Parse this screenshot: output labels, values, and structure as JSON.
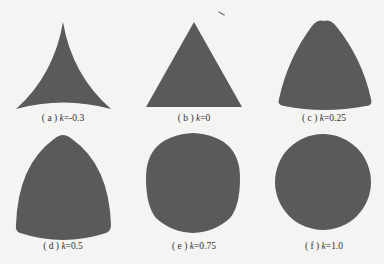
{
  "figure": {
    "fill_color": "#5a5a5a",
    "background": "#f4f4f2",
    "panels": [
      {
        "id": "a",
        "label": "( a )",
        "param": "k",
        "value": "=-0.3",
        "shape": "concave-triangle"
      },
      {
        "id": "b",
        "label": "( b )",
        "param": "k",
        "value": "=0",
        "shape": "triangle"
      },
      {
        "id": "c",
        "label": "( c )",
        "param": "k",
        "value": "=0.25",
        "shape": "convex-triangle"
      },
      {
        "id": "d",
        "label": "( d )",
        "param": "k",
        "value": "=0.5",
        "shape": "reuleaux-like-triangle"
      },
      {
        "id": "e",
        "label": "( e )",
        "param": "k",
        "value": "=0.75",
        "shape": "rounded-triangle"
      },
      {
        "id": "f",
        "label": "( f )",
        "param": "k",
        "value": "=1.0",
        "shape": "circle"
      }
    ]
  }
}
